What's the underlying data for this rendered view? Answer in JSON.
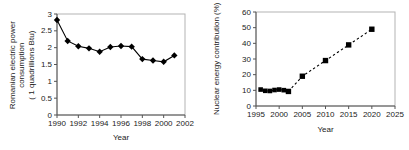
{
  "page": {
    "background": "#ffffff",
    "text_color": "#222222",
    "plot_frame_color": "#b3b3b3",
    "axis_color": "#555555",
    "data_color": "#000000"
  },
  "chart_data": [
    {
      "id": "romanian-electric-power-consumption",
      "type": "line",
      "title": "",
      "xlabel": "Year",
      "ylabel": "Romanian electric power\nconsumption\n( 1 quadrillions Btu)",
      "xlim": [
        1990,
        2002
      ],
      "ylim": [
        0,
        3
      ],
      "xticks": [
        1990,
        1992,
        1994,
        1996,
        1998,
        2000,
        2002
      ],
      "yticks": [
        0,
        0.5,
        1,
        1.5,
        2,
        2.5,
        3
      ],
      "grid": false,
      "legend": "none",
      "series": [
        {
          "name": "consumption",
          "marker": "diamond",
          "marker_size": 2.6,
          "line_style": "solid",
          "color": "#000000",
          "x": [
            1990,
            1991,
            1992,
            1993,
            1994,
            1995,
            1996,
            1997,
            1998,
            1999,
            2000,
            2001
          ],
          "y": [
            2.82,
            2.2,
            2.04,
            1.98,
            1.88,
            2.02,
            2.05,
            2.03,
            1.66,
            1.62,
            1.58,
            1.77
          ]
        }
      ]
    },
    {
      "id": "nuclear-energy-contribution",
      "type": "line",
      "title": "",
      "xlabel": "Year",
      "ylabel": "Nuclear energy contribution (%)",
      "xlim": [
        1995,
        2025
      ],
      "ylim": [
        0,
        60
      ],
      "xticks": [
        1995,
        2000,
        2005,
        2010,
        2015,
        2020,
        2025
      ],
      "yticks": [
        0,
        10,
        20,
        30,
        40,
        50,
        60
      ],
      "grid": false,
      "legend": "none",
      "series": [
        {
          "name": "historical",
          "marker": "square",
          "marker_size": 2.3,
          "line_style": "solid",
          "color": "#000000",
          "x": [
            1996,
            1997,
            1998,
            1999,
            2000,
            2001,
            2002
          ],
          "y": [
            10.5,
            9.7,
            9.6,
            10.2,
            10.5,
            10.1,
            9.3
          ]
        },
        {
          "name": "projected",
          "marker": "square",
          "marker_size": 2.7,
          "line_style": "dashed",
          "color": "#000000",
          "x": [
            2002,
            2005,
            2010,
            2015,
            2020
          ],
          "y": [
            9.3,
            19,
            29,
            39,
            49
          ]
        }
      ]
    }
  ]
}
